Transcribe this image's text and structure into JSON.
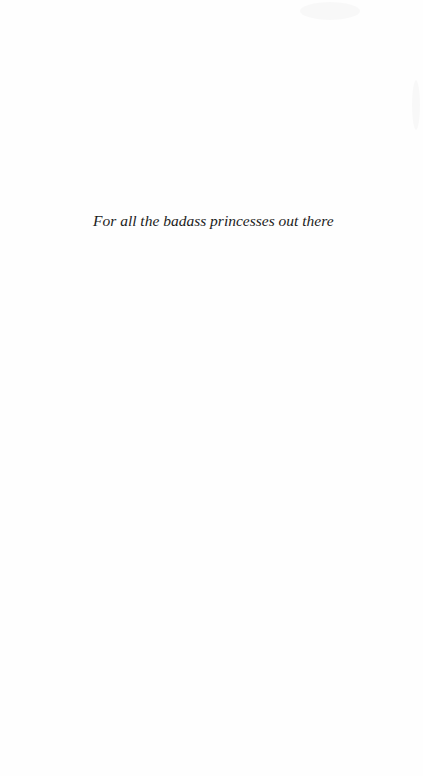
{
  "page": {
    "dedication": "For all the badass princesses out there"
  }
}
